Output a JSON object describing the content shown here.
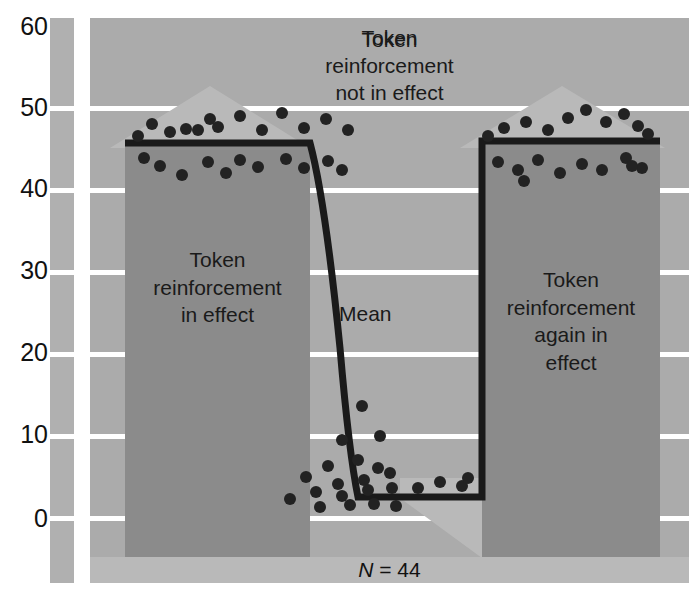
{
  "chart_data": {
    "type": "line",
    "title": "",
    "xlabel": "",
    "ylabel": "",
    "ylim": [
      0,
      60
    ],
    "yticks": [
      0,
      10,
      20,
      30,
      40,
      50,
      60
    ],
    "grid": true,
    "legend_position": "none",
    "annotations": {
      "top_center": "Token\nreinforcement\nnot in effect",
      "left_block": "Token\nreinforcement\nin effect",
      "right_block": "Token\nreinforcement\nagain in\neffect",
      "mean_curve": "Mean",
      "sample_size": "N = 44",
      "sample_size_symbol": "N",
      "sample_size_value": "= 44"
    },
    "phases": [
      {
        "name": "Token reinforcement in effect",
        "mean_level": 45,
        "x_start": 0,
        "x_end": 37
      },
      {
        "name": "Token reinforcement not in effect",
        "mean_start": 45,
        "mean_end": 2,
        "x_start": 37,
        "x_end": 66
      },
      {
        "name": "Token reinforcement again in effect",
        "mean_level": 46,
        "x_start": 66,
        "x_end": 100
      }
    ],
    "series": [
      {
        "name": "Mean",
        "type": "line",
        "points": [
          [
            0,
            45
          ],
          [
            37,
            45
          ],
          [
            40,
            38
          ],
          [
            43,
            30
          ],
          [
            46,
            23
          ],
          [
            49,
            17
          ],
          [
            52,
            12
          ],
          [
            55,
            8
          ],
          [
            58,
            5
          ],
          [
            61,
            3
          ],
          [
            64,
            2
          ],
          [
            66,
            2
          ],
          [
            66,
            46
          ],
          [
            100,
            46
          ]
        ]
      },
      {
        "name": "Individual scores",
        "type": "scatter",
        "points": [
          [
            5,
            50
          ],
          [
            7,
            47
          ],
          [
            9,
            48
          ],
          [
            11,
            47
          ],
          [
            13,
            52
          ],
          [
            15,
            47
          ],
          [
            18,
            53
          ],
          [
            20,
            48
          ],
          [
            22,
            49
          ],
          [
            25,
            51
          ],
          [
            28,
            47
          ],
          [
            31,
            52
          ],
          [
            34,
            48
          ],
          [
            6,
            43
          ],
          [
            9,
            41
          ],
          [
            12,
            44
          ],
          [
            15,
            40
          ],
          [
            18,
            43
          ],
          [
            21,
            44
          ],
          [
            24,
            42
          ],
          [
            27,
            43
          ],
          [
            30,
            41
          ],
          [
            33,
            43
          ],
          [
            35,
            44
          ],
          [
            43,
            16
          ],
          [
            46,
            12
          ],
          [
            48,
            9
          ],
          [
            50,
            11
          ],
          [
            52,
            8
          ],
          [
            54,
            10
          ],
          [
            55,
            6
          ],
          [
            57,
            7
          ],
          [
            58,
            4
          ],
          [
            59,
            9
          ],
          [
            60,
            3
          ],
          [
            61,
            5
          ],
          [
            62,
            2
          ],
          [
            63,
            4
          ],
          [
            64,
            6
          ],
          [
            65,
            3
          ],
          [
            67,
            3
          ],
          [
            70,
            3
          ],
          [
            73,
            4
          ],
          [
            76,
            3
          ],
          [
            71,
            50
          ],
          [
            74,
            52
          ],
          [
            77,
            49
          ],
          [
            79,
            51
          ],
          [
            82,
            48
          ],
          [
            85,
            52
          ],
          [
            88,
            50
          ],
          [
            91,
            49
          ],
          [
            94,
            51
          ],
          [
            73,
            44
          ],
          [
            76,
            43
          ],
          [
            79,
            41
          ],
          [
            82,
            44
          ],
          [
            85,
            42
          ],
          [
            88,
            43
          ],
          [
            91,
            45
          ],
          [
            93,
            44
          ]
        ]
      }
    ]
  },
  "axis": {
    "ytick_labels": [
      "60",
      "50",
      "40",
      "30",
      "20",
      "10",
      "0"
    ]
  },
  "colors": {
    "plot_background": "#ababab",
    "block_fill": "#8b8b8b",
    "arrow_fill": "#b9b9b9",
    "gridline": "#ffffff",
    "line": "#1a1a1a",
    "point": "#222222",
    "caption_band": "#b9b9b9",
    "strip": "#b0b0b0",
    "text": "#111111"
  }
}
